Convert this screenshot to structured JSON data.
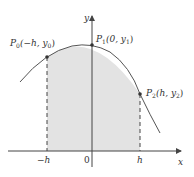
{
  "figure": {
    "axes": {
      "x_label": "x",
      "y_label": "y",
      "origin_label": "0",
      "tick_neg_h": "−h",
      "tick_h": "h"
    },
    "points": [
      {
        "id": "P0",
        "name": "P",
        "sub": "0",
        "coords": "(−h, y",
        "coord_sub": "0",
        "close": ")"
      },
      {
        "id": "P1",
        "name": "P",
        "sub": "1",
        "coords": "(0, y",
        "coord_sub": "1",
        "close": ")"
      },
      {
        "id": "P2",
        "name": "P",
        "sub": "2",
        "coords": "(h, y",
        "coord_sub": "2",
        "close": ")"
      }
    ],
    "colors": {
      "curve": "#555555",
      "shade": "#e3e3e3",
      "axis": "#444444",
      "point": "#333333"
    }
  }
}
